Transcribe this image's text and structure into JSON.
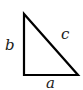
{
  "diagram": {
    "type": "right-triangle",
    "labels": {
      "vertical_side": "b",
      "hypotenuse": "c",
      "horizontal_side": "a"
    },
    "stroke_color": "#000000"
  }
}
